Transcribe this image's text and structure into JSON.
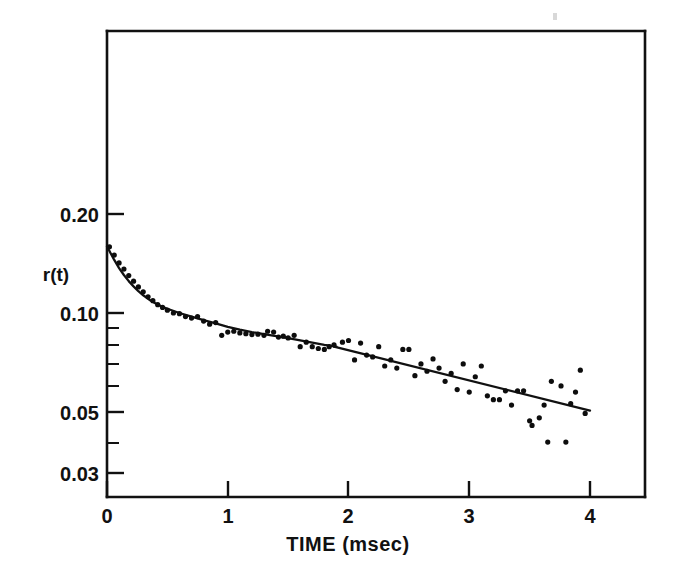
{
  "figure": {
    "background_color": "#ffffff",
    "ink_color": "#111111",
    "point_color": "#0d0d0d"
  },
  "axes": {
    "x_title": "TIME  (msec)",
    "y_title": "r(t)",
    "x_tick_labels": [
      "0",
      "1",
      "2",
      "3",
      "4"
    ],
    "y_tick_labels": [
      "0.20",
      "0.10",
      "0.05",
      "0.03"
    ]
  },
  "chart_data": {
    "type": "scatter",
    "title": "",
    "subtitle": "",
    "xlabel": "TIME  (msec)",
    "ylabel": "r(t)",
    "xlim": [
      0,
      4.25
    ],
    "ylim": [
      0.027,
      0.4
    ],
    "yscale": "log",
    "xscale": "linear",
    "grid": false,
    "legend": null,
    "x_ticks": [
      0,
      1,
      2,
      3,
      4
    ],
    "x_tick_labels": [
      "0",
      "1",
      "2",
      "3",
      "4"
    ],
    "y_ticks": [
      0.2,
      0.1,
      0.05,
      0.03
    ],
    "y_tick_labels": [
      "0.20",
      "0.10",
      "0.05",
      "0.03"
    ],
    "y_minor_ticks": [
      0.09,
      0.08,
      0.07,
      0.06,
      0.04
    ],
    "annotations": [],
    "series": [
      {
        "name": "measured anisotropy data",
        "type": "scatter",
        "marker": "filled-circle",
        "marker_size_px": 5.2,
        "points": [
          [
            0.02,
            0.159
          ],
          [
            0.06,
            0.15
          ],
          [
            0.1,
            0.142
          ],
          [
            0.14,
            0.136
          ],
          [
            0.18,
            0.13
          ],
          [
            0.22,
            0.125
          ],
          [
            0.26,
            0.12
          ],
          [
            0.3,
            0.116
          ],
          [
            0.34,
            0.112
          ],
          [
            0.38,
            0.109
          ],
          [
            0.42,
            0.106
          ],
          [
            0.46,
            0.104
          ],
          [
            0.5,
            0.102
          ],
          [
            0.55,
            0.1
          ],
          [
            0.6,
            0.0995
          ],
          [
            0.65,
            0.0975
          ],
          [
            0.7,
            0.0965
          ],
          [
            0.75,
            0.0975
          ],
          [
            0.8,
            0.0945
          ],
          [
            0.85,
            0.0925
          ],
          [
            0.9,
            0.0935
          ],
          [
            0.95,
            0.0855
          ],
          [
            1.0,
            0.0875
          ],
          [
            1.05,
            0.088
          ],
          [
            1.1,
            0.087
          ],
          [
            1.15,
            0.0865
          ],
          [
            1.2,
            0.086
          ],
          [
            1.25,
            0.0862
          ],
          [
            1.3,
            0.0855
          ],
          [
            1.33,
            0.088
          ],
          [
            1.38,
            0.0875
          ],
          [
            1.42,
            0.0845
          ],
          [
            1.46,
            0.085
          ],
          [
            1.5,
            0.084
          ],
          [
            1.55,
            0.0855
          ],
          [
            1.6,
            0.079
          ],
          [
            1.65,
            0.0815
          ],
          [
            1.7,
            0.079
          ],
          [
            1.75,
            0.078
          ],
          [
            1.8,
            0.0775
          ],
          [
            1.84,
            0.079
          ],
          [
            1.88,
            0.08
          ],
          [
            1.95,
            0.0815
          ],
          [
            2.0,
            0.0825
          ],
          [
            2.05,
            0.072
          ],
          [
            2.1,
            0.081
          ],
          [
            2.15,
            0.0745
          ],
          [
            2.2,
            0.0735
          ],
          [
            2.25,
            0.079
          ],
          [
            2.3,
            0.069
          ],
          [
            2.35,
            0.072
          ],
          [
            2.4,
            0.068
          ],
          [
            2.45,
            0.0775
          ],
          [
            2.5,
            0.0775
          ],
          [
            2.55,
            0.0645
          ],
          [
            2.6,
            0.07
          ],
          [
            2.65,
            0.0665
          ],
          [
            2.7,
            0.0725
          ],
          [
            2.75,
            0.068
          ],
          [
            2.8,
            0.062
          ],
          [
            2.85,
            0.0655
          ],
          [
            2.9,
            0.0585
          ],
          [
            2.95,
            0.07
          ],
          [
            3.0,
            0.0575
          ],
          [
            3.05,
            0.064
          ],
          [
            3.1,
            0.069
          ],
          [
            3.15,
            0.056
          ],
          [
            3.2,
            0.0545
          ],
          [
            3.25,
            0.0545
          ],
          [
            3.3,
            0.058
          ],
          [
            3.35,
            0.0525
          ],
          [
            3.4,
            0.058
          ],
          [
            3.45,
            0.058
          ],
          [
            3.5,
            0.047
          ],
          [
            3.52,
            0.0455
          ],
          [
            3.58,
            0.048
          ],
          [
            3.62,
            0.0525
          ],
          [
            3.65,
            0.0405
          ],
          [
            3.68,
            0.062
          ],
          [
            3.76,
            0.06
          ],
          [
            3.8,
            0.0405
          ],
          [
            3.84,
            0.053
          ],
          [
            3.88,
            0.0575
          ],
          [
            3.92,
            0.067
          ],
          [
            3.96,
            0.0495
          ]
        ]
      },
      {
        "name": "biexponential fit curve",
        "type": "line",
        "points": [
          [
            0.0,
            0.1595
          ],
          [
            0.03,
            0.152
          ],
          [
            0.06,
            0.145
          ],
          [
            0.1,
            0.137
          ],
          [
            0.14,
            0.1305
          ],
          [
            0.18,
            0.125
          ],
          [
            0.22,
            0.1205
          ],
          [
            0.26,
            0.1165
          ],
          [
            0.3,
            0.1132
          ],
          [
            0.35,
            0.1098
          ],
          [
            0.4,
            0.107
          ],
          [
            0.45,
            0.1048
          ],
          [
            0.5,
            0.103
          ],
          [
            0.6,
            0.1
          ],
          [
            0.7,
            0.0975
          ],
          [
            0.8,
            0.0952
          ],
          [
            0.9,
            0.093
          ],
          [
            1.0,
            0.0908
          ],
          [
            1.1,
            0.089
          ],
          [
            1.2,
            0.0875
          ],
          [
            1.3,
            0.0862
          ],
          [
            1.4,
            0.085
          ],
          [
            1.5,
            0.0838
          ],
          [
            1.6,
            0.0825
          ],
          [
            1.7,
            0.0812
          ],
          [
            1.8,
            0.08
          ],
          [
            1.9,
            0.079
          ]
        ]
      },
      {
        "name": "linear tail fit",
        "type": "line",
        "points": [
          [
            1.88,
            0.079
          ],
          [
            4.0,
            0.0505
          ]
        ]
      }
    ]
  }
}
